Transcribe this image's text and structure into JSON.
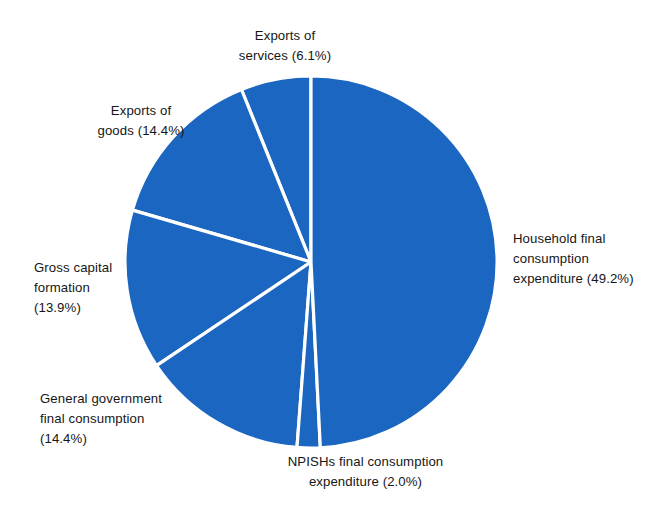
{
  "chart_data": {
    "type": "pie",
    "title": "",
    "subtitle": "",
    "xlabel": "",
    "ylabel": "",
    "grid": false,
    "legend_position": "none",
    "unit": "%",
    "start_angle_deg": 90,
    "direction": "counterclockwise",
    "colors": {
      "slice_fill": "#1A66C0",
      "separator": "#FFFFFF",
      "label_text": "#161616",
      "background": "#FFFFFF"
    },
    "categories": [
      "Exports of services",
      "Exports of goods",
      "Gross capital formation",
      "General government final consumption",
      "NPISHs final consumption expenditure",
      "Household final consumption expenditure"
    ],
    "values": [
      6.1,
      14.4,
      13.9,
      14.4,
      2.0,
      49.2
    ],
    "slices": [
      {
        "name": "exports-of-services",
        "label_lines": "Exports of\nservices (6.1%)",
        "category": "Exports of services",
        "value": 6.1,
        "value_text": "6.1%"
      },
      {
        "name": "exports-of-goods",
        "label_lines": "Exports of\ngoods (14.4%)",
        "category": "Exports of goods",
        "value": 14.4,
        "value_text": "14.4%"
      },
      {
        "name": "gross-capital-formation",
        "label_lines": "Gross capital\nformation\n(13.9%)",
        "category": "Gross capital formation",
        "value": 13.9,
        "value_text": "13.9%"
      },
      {
        "name": "general-government-final-consumption",
        "label_lines": "General government\nfinal consumption\n(14.4%)",
        "category": "General government final consumption",
        "value": 14.4,
        "value_text": "14.4%"
      },
      {
        "name": "npishs-final-consumption-expenditure",
        "label_lines": "NPISHs final consumption\nexpenditure (2.0%)",
        "category": "NPISHs final consumption expenditure",
        "value": 2.0,
        "value_text": "2.0%"
      },
      {
        "name": "household-final-consumption-expenditure",
        "label_lines": "Household final\nconsumption\nexpenditure (49.2%)",
        "category": "Household final consumption expenditure",
        "value": 49.2,
        "value_text": "49.2%"
      }
    ]
  }
}
